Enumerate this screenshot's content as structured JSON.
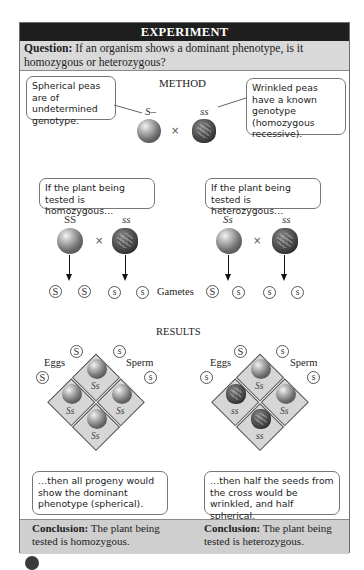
{
  "header": {
    "title": "EXPERIMENT"
  },
  "question": {
    "label": "Question:",
    "text": " If an organism shows a dominant phenotype, is it homozygous or heterozygous?"
  },
  "method": {
    "title": "METHOD",
    "left_callout": "Spherical peas are of undetermined genotype.",
    "right_callout": "Wrinkled peas have a known genotype (homozygous recessive).",
    "left_genotype": "S–",
    "right_genotype": "ss",
    "cross_symbol": "×"
  },
  "cases": {
    "homozygous": {
      "callout": "If the plant being tested is homozygous…",
      "parent1_genotype": "SS",
      "parent2_genotype": "ss",
      "gametes": [
        "S",
        "S",
        "s",
        "s"
      ]
    },
    "heterozygous": {
      "callout": "If the plant being tested is heterozygous…",
      "parent1_genotype": "Ss",
      "parent2_genotype": "ss",
      "gametes": [
        "S",
        "s",
        "s",
        "s"
      ]
    },
    "gametes_label": "Gametes"
  },
  "results": {
    "title": "RESULTS",
    "eggs_label": "Eggs",
    "sperm_label": "Sperm",
    "homozygous": {
      "egg_gametes": [
        "S",
        "S"
      ],
      "sperm_gametes": [
        "s",
        "s"
      ],
      "cells": [
        "Ss",
        "Ss",
        "Ss",
        "Ss"
      ],
      "phenotypes": [
        "spherical",
        "spherical",
        "spherical",
        "spherical"
      ],
      "callout": "…then all progeny would show the dominant phenotype (spherical)."
    },
    "heterozygous": {
      "egg_gametes": [
        "S",
        "s"
      ],
      "sperm_gametes": [
        "s",
        "s"
      ],
      "cells": [
        "Ss",
        "ss",
        "Ss",
        "ss"
      ],
      "phenotypes": [
        "spherical",
        "wrinkled",
        "spherical",
        "wrinkled"
      ],
      "callout": "…then half the seeds from the cross would be wrinkled, and half spherical."
    }
  },
  "conclusion": {
    "label": "Conclusion:",
    "left_text": " The plant being tested is homozygous.",
    "right_text": " The plant being tested is heterozygous."
  }
}
